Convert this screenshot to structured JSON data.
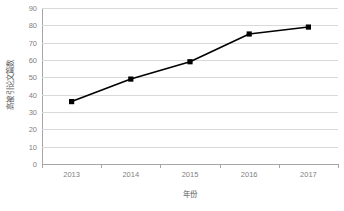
{
  "chart_data": {
    "type": "line",
    "title": "",
    "subtitle": "",
    "xlabel": "年份",
    "ylabel": "高被引论文篇数",
    "categories": [
      "2013",
      "2014",
      "2015",
      "2016",
      "2017"
    ],
    "values": [
      36,
      49,
      59,
      75,
      79
    ],
    "series": [
      {
        "name": "高被引论文篇数",
        "values": [
          36,
          49,
          59,
          75,
          79
        ]
      }
    ],
    "ylim": [
      0,
      90
    ],
    "ytick_labels": [
      "0",
      "10",
      "20",
      "30",
      "40",
      "50",
      "60",
      "70",
      "80",
      "90"
    ],
    "ytick_values": [
      0,
      10,
      20,
      30,
      40,
      50,
      60,
      70,
      80,
      90
    ],
    "xtick_labels": [
      "2013",
      "2014",
      "2015",
      "2016",
      "2017"
    ],
    "grid": "horizontal",
    "legend": "none",
    "marker": "square",
    "colors": {
      "line": "#000000",
      "marker": "#000000",
      "gridline": "#d9d9d9",
      "axis": "#a6a6a6",
      "tick_text": "#7f7f7f",
      "axis_title_text": "#595959",
      "background": "#ffffff"
    }
  }
}
